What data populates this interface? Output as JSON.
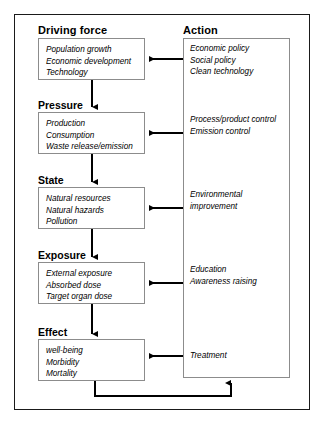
{
  "diagram": {
    "columns": {
      "left_heading": "Driving force",
      "right_heading": "Action"
    },
    "colors": {
      "frame": "#1a1a1a",
      "box_border": "#8c8c8c",
      "arrow": "#000000",
      "text": "#000000",
      "background": "#ffffff"
    },
    "stages": [
      {
        "id": "driving-force",
        "label": "Driving force",
        "items": [
          "Population growth",
          "Economic development",
          "Technology"
        ]
      },
      {
        "id": "pressure",
        "label": "Pressure",
        "items": [
          "Production",
          "Consumption",
          "Waste release/emission"
        ]
      },
      {
        "id": "state",
        "label": "State",
        "items": [
          "Natural resources",
          "Natural hazards",
          "Pollution"
        ]
      },
      {
        "id": "exposure",
        "label": "Exposure",
        "items": [
          "External exposure",
          "Absorbed dose",
          "Target organ dose"
        ]
      },
      {
        "id": "effect",
        "label": "Effect",
        "items": [
          "well-being",
          "Morbidity",
          "Mortality"
        ]
      }
    ],
    "actions": [
      {
        "id": "action-driving-force",
        "target": "driving-force",
        "items": [
          "Economic policy",
          "Social policy",
          "Clean technology"
        ]
      },
      {
        "id": "action-pressure",
        "target": "pressure",
        "items": [
          "Process/product control",
          "Emission control"
        ]
      },
      {
        "id": "action-state",
        "target": "state",
        "items": [
          "Environmental",
          "improvement"
        ]
      },
      {
        "id": "action-exposure",
        "target": "exposure",
        "items": [
          "Education",
          "Awareness raising"
        ]
      },
      {
        "id": "action-effect",
        "target": "effect",
        "items": [
          "Treatment"
        ]
      }
    ]
  }
}
